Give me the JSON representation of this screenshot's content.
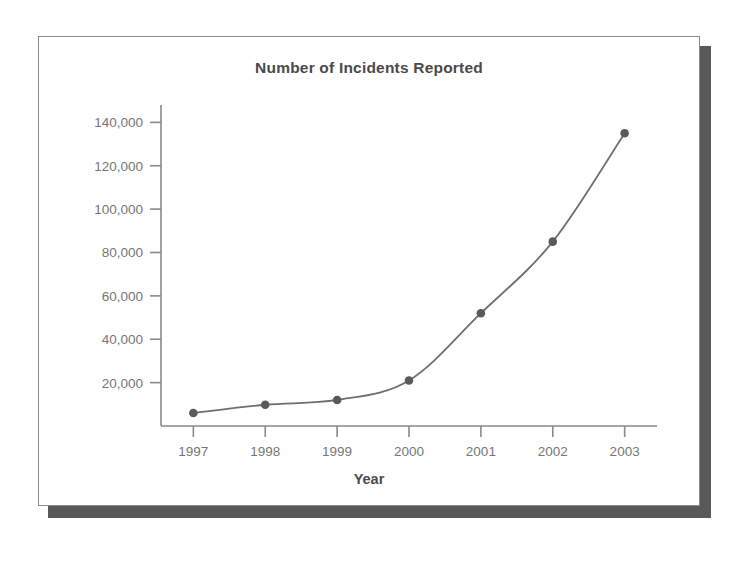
{
  "panel": {
    "border_color": "#8a8a8a",
    "background": "#ffffff",
    "shadow_color": "#595959"
  },
  "chart_data": {
    "type": "line",
    "title": "Number of Incidents Reported",
    "xlabel": "Year",
    "ylabel": "",
    "categories": [
      "1997",
      "1998",
      "1999",
      "2000",
      "2001",
      "2002",
      "2003"
    ],
    "x": [
      1997,
      1998,
      1999,
      2000,
      2001,
      2002,
      2003
    ],
    "values": [
      6000,
      9800,
      12000,
      21000,
      52000,
      85000,
      135000
    ],
    "series": [
      {
        "name": "Number of Incidents Reported",
        "values": [
          6000,
          9800,
          12000,
          21000,
          52000,
          85000,
          135000
        ]
      }
    ],
    "ylim": [
      0,
      148000
    ],
    "xlim": [
      1996.55,
      2003.45
    ],
    "yticks": [
      20000,
      40000,
      60000,
      80000,
      100000,
      120000,
      140000
    ],
    "ytick_labels": [
      "20,000",
      "40,000",
      "60,000",
      "80,000",
      "100,000",
      "120,000",
      "140,000"
    ],
    "xticks": [
      1997,
      1998,
      1999,
      2000,
      2001,
      2002,
      2003
    ],
    "xtick_labels": [
      "1997",
      "1998",
      "1999",
      "2000",
      "2001",
      "2002",
      "2003"
    ],
    "grid": false,
    "legend": false,
    "legend_position": "none",
    "line_color": "#6f6f6f",
    "marker_color": "#5a5a5a",
    "marker": "circle",
    "axis_color": "#8a8a8a",
    "tick_label_color": "#767676",
    "title_color": "#4a4a4a"
  }
}
